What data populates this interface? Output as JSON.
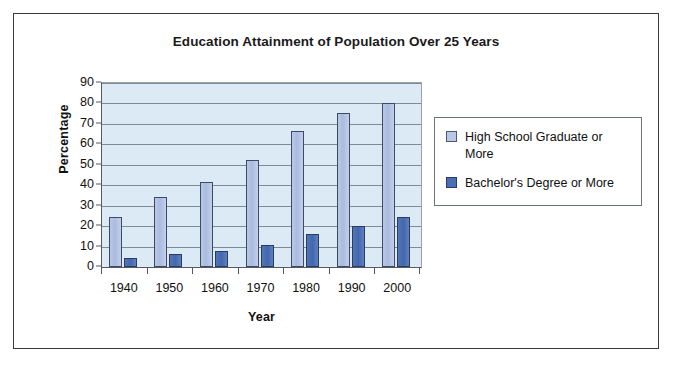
{
  "chart_data": {
    "type": "bar",
    "title": "Education Attainment of Population Over 25 Years",
    "xlabel": "Year",
    "ylabel": "Percentage",
    "categories": [
      "1940",
      "1950",
      "1960",
      "1970",
      "1980",
      "1990",
      "2000"
    ],
    "series": [
      {
        "name": "High School Graduate or More",
        "color": "#b9c8e6",
        "values": [
          24.5,
          34.3,
          41.8,
          52.3,
          66.5,
          75.2,
          80.4
        ]
      },
      {
        "name": "Bachelor's Degree or More",
        "color": "#4a6fb5",
        "values": [
          4.6,
          6.2,
          7.7,
          11.0,
          16.2,
          20.3,
          24.4
        ]
      }
    ],
    "ylim": [
      0,
      90
    ],
    "yticks": [
      "0",
      "10",
      "20",
      "30",
      "40",
      "50",
      "60",
      "70",
      "80",
      "90"
    ],
    "ytick_step": 10,
    "grid": "horizontal",
    "legend_position": "right",
    "plot_background": "#dbeaf5"
  },
  "legend": {
    "items": [
      {
        "label": "High School Graduate or More",
        "swatch": "series-hs"
      },
      {
        "label": "Bachelor's Degree or More",
        "swatch": "series-ba"
      }
    ]
  }
}
